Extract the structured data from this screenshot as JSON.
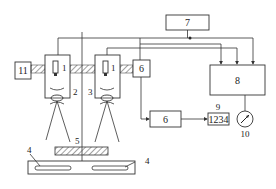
{
  "diagram": {
    "blocks": {
      "b7": {
        "label": "7"
      },
      "b8": {
        "label": "8"
      },
      "b11": {
        "label": "11"
      },
      "b6_top": {
        "label": "6"
      },
      "b6_bottom": {
        "label": "6"
      },
      "b9": {
        "label": "1234"
      }
    },
    "labels": {
      "sensor_left": "1",
      "sensor_right": "1",
      "n2": "2",
      "n3": "3",
      "n4_left": "4",
      "n4_right": "4",
      "n5": "5",
      "n9": "9",
      "n10": "10"
    },
    "colors": {
      "line": "#333333",
      "background": "#ffffff",
      "hatch": "#444444"
    }
  }
}
